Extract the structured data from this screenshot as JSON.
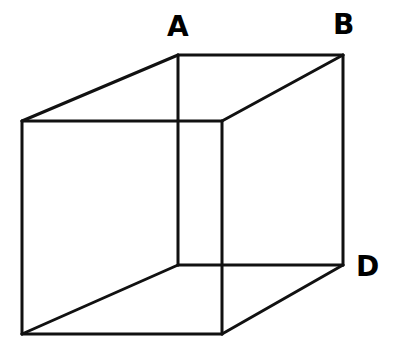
{
  "diagram": {
    "type": "necker-cube",
    "stroke_color": "#111111",
    "stroke_width": 3,
    "vertices": {
      "front_top_left": [
        22,
        121
      ],
      "front_top_right": [
        222,
        121
      ],
      "front_bottom_left": [
        22,
        334
      ],
      "front_bottom_right": [
        222,
        334
      ],
      "back_top_left": [
        178,
        55
      ],
      "back_top_right": [
        343,
        55
      ],
      "back_bottom_left": [
        178,
        265
      ],
      "back_bottom_right": [
        343,
        265
      ]
    },
    "labels": [
      {
        "text": "A",
        "vertex": "back_top_left",
        "x": 167,
        "y": 13
      },
      {
        "text": "B",
        "vertex": "back_top_right",
        "x": 333,
        "y": 11
      },
      {
        "text": "D",
        "vertex": "back_bottom_right",
        "x": 356,
        "y": 253
      }
    ]
  }
}
